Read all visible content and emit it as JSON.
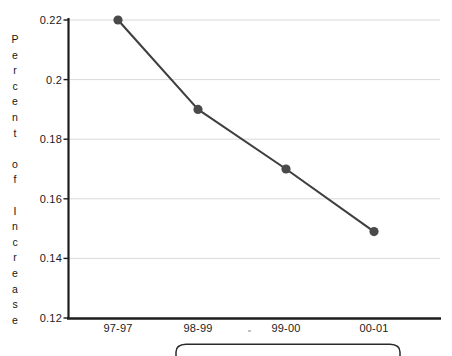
{
  "chart_data": {
    "type": "line",
    "title": "",
    "xlabel": "",
    "ylabel": "Percent of Increase",
    "categories": [
      "97-97",
      "98-99",
      "99-00",
      "00-01"
    ],
    "values": [
      0.22,
      0.19,
      0.17,
      0.149
    ],
    "series": [
      {
        "name": "Percent of Increase",
        "values": [
          0.22,
          0.19,
          0.17,
          0.149
        ]
      }
    ],
    "ylim": [
      0.12,
      0.22
    ],
    "yticks": [
      "0.22",
      "0.2",
      "0.18",
      "0.16",
      "0.14",
      "0.12"
    ],
    "ytick_values": [
      0.22,
      0.2,
      0.18,
      0.16,
      0.14,
      0.12
    ],
    "grid": true,
    "grid_axis": "y",
    "legend": "",
    "legend_position": "bottom",
    "marker": "circle",
    "line_color": "#3f3f3f",
    "marker_color": "#4a4a4a",
    "grid_color": "#d9d9d9",
    "axis_color": "#1a1a1a"
  },
  "axis": {
    "y_title_letters": [
      "P",
      "e",
      "r",
      "c",
      "e",
      "n",
      "t",
      "",
      "o",
      "f",
      "",
      "I",
      "n",
      "c",
      "r",
      "e",
      "a",
      "s",
      "e"
    ]
  },
  "legend_box": {
    "label": ""
  }
}
